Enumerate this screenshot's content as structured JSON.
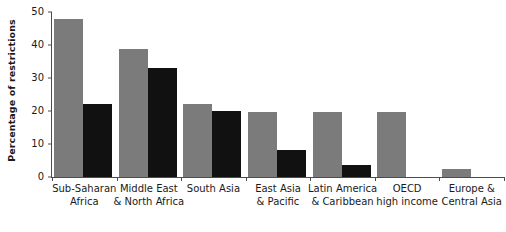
{
  "chart_data": {
    "type": "bar",
    "title": "",
    "subtitle": "",
    "xlabel": "",
    "ylabel": "Percentage of restrictions",
    "ylim": [
      0,
      50
    ],
    "yticks": [
      0,
      10,
      20,
      30,
      40,
      50
    ],
    "ytick_labels": [
      "0",
      "10",
      "20",
      "30",
      "40",
      "50"
    ],
    "grid": false,
    "legend": null,
    "legend_position": "none",
    "categories": [
      "Sub-Saharan Africa",
      "Middle East & North Africa",
      "South Asia",
      "East Asia & Pacific",
      "Latin America & Caribbean",
      "OECD high income",
      "Europe & Central Asia"
    ],
    "category_lines": [
      [
        "Sub-Saharan",
        "Africa"
      ],
      [
        "Middle East",
        "& North Africa"
      ],
      [
        "South Asia",
        ""
      ],
      [
        "East Asia",
        "& Pacific"
      ],
      [
        "Latin America",
        "& Caribbean"
      ],
      [
        "OECD",
        "high income"
      ],
      [
        "Europe &",
        "Central Asia"
      ]
    ],
    "series": [
      {
        "name": "series-gray",
        "color": "#7b7b7b",
        "values": [
          48,
          38.7,
          22,
          19.7,
          19.7,
          19.7,
          2.5
        ]
      },
      {
        "name": "series-black",
        "color": "#111111",
        "values": [
          22,
          33,
          20,
          8.3,
          3.5,
          0,
          0
        ]
      }
    ]
  },
  "colors": {
    "series_gray": "#7b7b7b",
    "series_black": "#111111",
    "axis": "#4d4d4d",
    "text": "#1a1a1a",
    "background": "#ffffff"
  }
}
